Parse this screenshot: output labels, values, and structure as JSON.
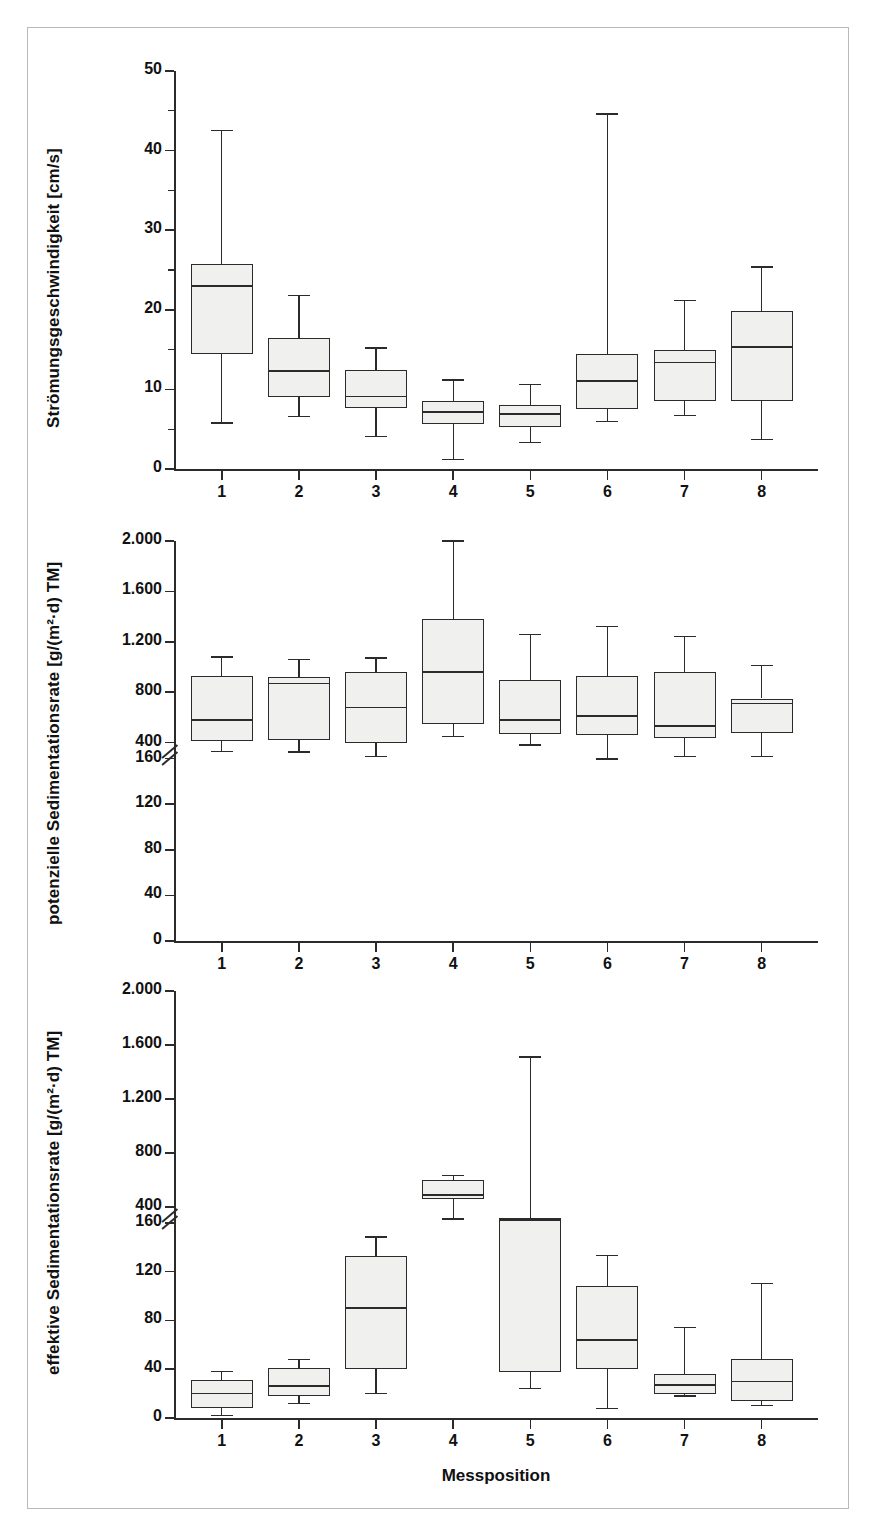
{
  "figure": {
    "xlabel": "Messposition",
    "xticklabels": [
      "1",
      "2",
      "3",
      "4",
      "5",
      "6",
      "7",
      "8"
    ],
    "box_fill": "#f0f0ef",
    "line_color": "#2b2b2b",
    "frame_color": "#b9b9b9"
  },
  "chart_data": [
    {
      "type": "box",
      "panel": 1,
      "title": "",
      "xlabel": "",
      "ylabel": "Strömungsgeschwindigkeit [cm/s]",
      "categories": [
        "1",
        "2",
        "3",
        "4",
        "5",
        "6",
        "7",
        "8"
      ],
      "yticklabels": [
        "0",
        "10",
        "20",
        "30",
        "40",
        "50"
      ],
      "ytickvalues": [
        0,
        10,
        20,
        30,
        40,
        50
      ],
      "minor_ticks": [
        5,
        15,
        25,
        35,
        45
      ],
      "ylim": [
        0,
        50
      ],
      "grid": false,
      "legend": "none",
      "axis_break": false,
      "boxes": [
        {
          "category": "1",
          "whisker_low": 5.8,
          "q1": 14.4,
          "median": 23.0,
          "q3": 25.8,
          "whisker_high": 42.5
        },
        {
          "category": "2",
          "whisker_low": 6.6,
          "q1": 9.1,
          "median": 12.3,
          "q3": 16.5,
          "whisker_high": 21.8
        },
        {
          "category": "3",
          "whisker_low": 4.1,
          "q1": 7.7,
          "median": 9.1,
          "q3": 12.4,
          "whisker_high": 15.2
        },
        {
          "category": "4",
          "whisker_low": 1.2,
          "q1": 5.6,
          "median": 7.2,
          "q3": 8.5,
          "whisker_high": 11.2
        },
        {
          "category": "5",
          "whisker_low": 3.3,
          "q1": 5.3,
          "median": 6.9,
          "q3": 8.1,
          "whisker_high": 10.6
        },
        {
          "category": "6",
          "whisker_low": 6.0,
          "q1": 7.6,
          "median": 11.1,
          "q3": 14.5,
          "whisker_high": 44.6
        },
        {
          "category": "7",
          "whisker_low": 6.7,
          "q1": 8.5,
          "median": 13.4,
          "q3": 15.0,
          "whisker_high": 21.2
        },
        {
          "category": "8",
          "whisker_low": 3.7,
          "q1": 8.6,
          "median": 15.3,
          "q3": 19.8,
          "whisker_high": 25.4
        }
      ]
    },
    {
      "type": "box",
      "panel": 2,
      "title": "",
      "xlabel": "",
      "ylabel": "potenzielle Sedimentationsrate [g/(m²·d) TM]",
      "categories": [
        "1",
        "2",
        "3",
        "4",
        "5",
        "6",
        "7",
        "8"
      ],
      "yticklabels": [
        "0",
        "40",
        "80",
        "120",
        "160",
        "400",
        "800",
        "1.200",
        "1.600",
        "2.000"
      ],
      "ytickvalues": [
        0,
        40,
        80,
        120,
        160,
        400,
        800,
        1200,
        1600,
        2000
      ],
      "ylim": [
        0,
        2000
      ],
      "grid": false,
      "legend": "none",
      "axis_break": true,
      "axis_break_between": [
        160,
        400
      ],
      "boxes": [
        {
          "category": "1",
          "whisker_low": 330,
          "q1": 410,
          "median": 580,
          "q3": 930,
          "whisker_high": 1080
        },
        {
          "category": "2",
          "whisker_low": 325,
          "q1": 420,
          "median": 870,
          "q3": 920,
          "whisker_high": 1060
        },
        {
          "category": "3",
          "whisker_low": 290,
          "q1": 400,
          "median": 680,
          "q3": 960,
          "whisker_high": 1070
        },
        {
          "category": "4",
          "whisker_low": 450,
          "q1": 550,
          "median": 960,
          "q3": 1380,
          "whisker_high": 2000
        },
        {
          "category": "5",
          "whisker_low": 380,
          "q1": 470,
          "median": 580,
          "q3": 900,
          "whisker_high": 1260
        },
        {
          "category": "6",
          "whisker_low": 270,
          "q1": 460,
          "median": 610,
          "q3": 930,
          "whisker_high": 1320
        },
        {
          "category": "7",
          "whisker_low": 290,
          "q1": 440,
          "median": 530,
          "q3": 960,
          "whisker_high": 1240
        },
        {
          "category": "8",
          "whisker_low": 290,
          "q1": 480,
          "median": 710,
          "q3": 750,
          "whisker_high": 1010
        }
      ]
    },
    {
      "type": "box",
      "panel": 3,
      "title": "",
      "xlabel": "Messposition",
      "ylabel": "effektive Sedimentationsrate [g/(m²·d) TM]",
      "categories": [
        "1",
        "2",
        "3",
        "4",
        "5",
        "6",
        "7",
        "8"
      ],
      "yticklabels": [
        "0",
        "40",
        "80",
        "120",
        "160",
        "400",
        "800",
        "1.200",
        "1.600",
        "2.000"
      ],
      "ytickvalues": [
        0,
        40,
        80,
        120,
        160,
        400,
        800,
        1200,
        1600,
        2000
      ],
      "ylim": [
        0,
        2000
      ],
      "grid": false,
      "legend": "none",
      "axis_break": true,
      "axis_break_between": [
        160,
        400
      ],
      "boxes": [
        {
          "category": "1",
          "whisker_low": 2,
          "q1": 8,
          "median": 20,
          "q3": 31,
          "whisker_high": 38
        },
        {
          "category": "2",
          "whisker_low": 12,
          "q1": 18,
          "median": 26,
          "q3": 41,
          "whisker_high": 48
        },
        {
          "category": "3",
          "whisker_low": 20,
          "q1": 40,
          "median": 90,
          "q3": 133,
          "whisker_high": 175
        },
        {
          "category": "4",
          "whisker_low": 310,
          "q1": 460,
          "median": 490,
          "q3": 600,
          "whisker_high": 630
        },
        {
          "category": "5",
          "whisker_low": 24,
          "q1": 38,
          "median": 300,
          "q3": 320,
          "whisker_high": 1510
        },
        {
          "category": "6",
          "whisker_low": 8,
          "q1": 40,
          "median": 64,
          "q3": 108,
          "whisker_high": 133
        },
        {
          "category": "7",
          "whisker_low": 18,
          "q1": 20,
          "median": 27,
          "q3": 36,
          "whisker_high": 74
        },
        {
          "category": "8",
          "whisker_low": 10,
          "q1": 14,
          "median": 30,
          "q3": 48,
          "whisker_high": 110
        }
      ]
    }
  ]
}
